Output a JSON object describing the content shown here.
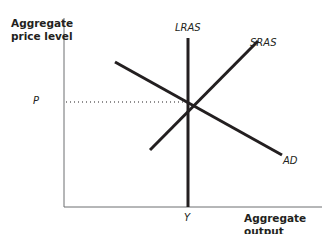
{
  "diagram": {
    "y_axis": {
      "label_line1": "Aggregate",
      "label_line2": "price level"
    },
    "x_axis": {
      "label": "Aggregate output"
    },
    "curves": {
      "lras": {
        "label": "LRAS"
      },
      "sras": {
        "label": "SRAS"
      },
      "ad": {
        "label": "AD"
      }
    },
    "equilibrium": {
      "price_label": "P",
      "output_label": "Y"
    },
    "colors": {
      "line": "#231f20",
      "axis": "#6d6e71",
      "background": "#ffffff"
    }
  }
}
